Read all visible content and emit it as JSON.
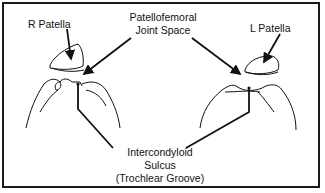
{
  "diagram": {
    "labels": {
      "r_patella": "R Patella",
      "l_patella": "L Patella",
      "joint_space_line1": "Patellofemoral",
      "joint_space_line2": "Joint Space",
      "sulcus_line1": "Intercondyloid",
      "sulcus_line2": "Sulcus",
      "sulcus_line3": "(Trochlear Groove)"
    },
    "colors": {
      "line": "#111111",
      "border": "#1a1a1a",
      "background": "#ffffff"
    }
  }
}
